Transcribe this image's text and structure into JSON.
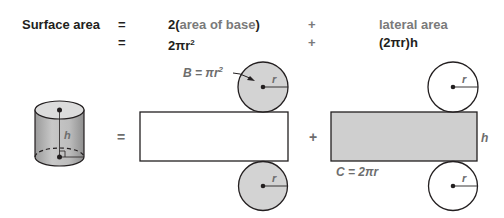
{
  "formula": {
    "row1": {
      "label": "Surface area",
      "equals": "=",
      "term1_prefix": "2(",
      "term1_text": "area of base",
      "term1_suffix": ")",
      "plus": "+",
      "term2_text": "lateral area"
    },
    "row2": {
      "equals": "=",
      "term1": "2πr",
      "term1_exp": "2",
      "plus": "+",
      "term2": "(2πr)h"
    }
  },
  "diagram": {
    "cylinder_height_label": "h",
    "equals_sign": "=",
    "plus_sign": "+",
    "base_area_label": "B = πr",
    "base_area_exp": "2",
    "radius_label": "r",
    "lateral_height_label": "h",
    "circumference_label": "C = 2πr",
    "colors": {
      "shaded": "#d0d0d0",
      "stroke": "#231f20",
      "label_gray": "#6d6d6d"
    }
  }
}
